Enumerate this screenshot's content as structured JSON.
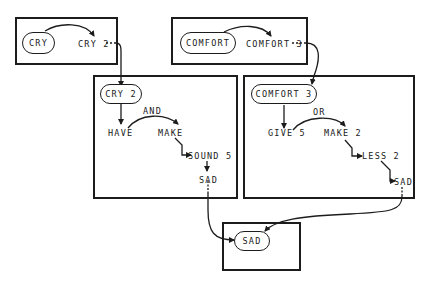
{
  "diagram": {
    "type": "concept-network",
    "frames": [
      {
        "id": "cry",
        "head": "CRY",
        "output": "CRY 2"
      },
      {
        "id": "comfort",
        "head": "COMFORT",
        "output": "COMFORT 3"
      },
      {
        "id": "cry2",
        "head": "CRY 2",
        "nodes": {
          "have": "HAVE",
          "make": "MAKE",
          "sound": "SOUND 5",
          "sad": "SAD"
        },
        "connector": "AND"
      },
      {
        "id": "comfort3",
        "head": "COMFORT 3",
        "nodes": {
          "give": "GIVE 5",
          "make": "MAKE 2",
          "less": "LESS 2",
          "sad": "SAD"
        },
        "connector": "OR"
      },
      {
        "id": "sad",
        "head": "SAD"
      }
    ],
    "edges": [
      {
        "from": "CRY",
        "to": "CRY 2",
        "style": "arc"
      },
      {
        "from": "CRY 2 (frame 1)",
        "to": "CRY 2 (frame 3)",
        "style": "dashed-then-solid"
      },
      {
        "from": "COMFORT",
        "to": "COMFORT 3",
        "style": "arc"
      },
      {
        "from": "COMFORT 3 (frame 2)",
        "to": "COMFORT 3 (frame 4)",
        "style": "dashed-then-solid"
      },
      {
        "from": "CRY 2",
        "to": "HAVE"
      },
      {
        "from": "HAVE",
        "to": "MAKE",
        "label": "AND"
      },
      {
        "from": "MAKE",
        "to": "SOUND 5"
      },
      {
        "from": "SOUND 5",
        "to": "SAD"
      },
      {
        "from": "COMFORT 3",
        "to": "GIVE 5"
      },
      {
        "from": "GIVE 5",
        "to": "MAKE 2",
        "label": "OR"
      },
      {
        "from": "MAKE 2",
        "to": "LESS 2"
      },
      {
        "from": "LESS 2",
        "to": "SAD"
      },
      {
        "from": "SAD (frame 3)",
        "to": "SAD (frame 5)"
      },
      {
        "from": "SAD (frame 4)",
        "to": "SAD (frame 5)"
      }
    ]
  }
}
